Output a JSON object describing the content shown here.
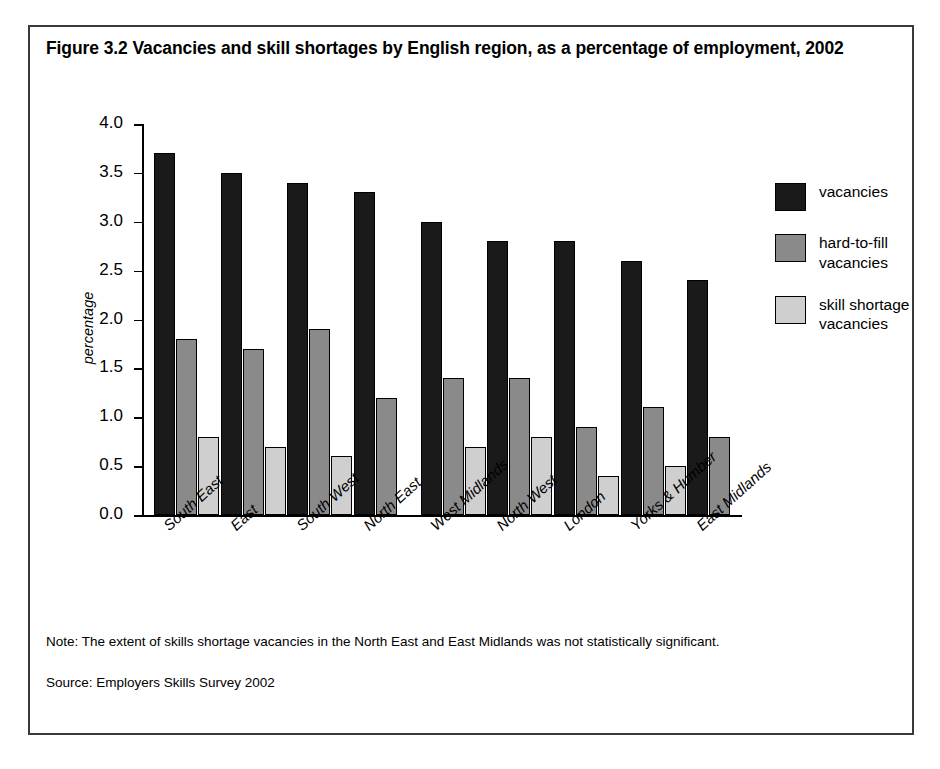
{
  "figure": {
    "title": "Figure 3.2 Vacancies and skill shortages by English region, as a percentage of employment, 2002",
    "note": "Note: The extent of skills shortage vacancies in the North East and East Midlands was not statistically significant.",
    "source": "Source: Employers Skills Survey 2002"
  },
  "legend": {
    "items": [
      {
        "label": "vacancies",
        "color": "#1a1a1a"
      },
      {
        "label": "hard-to-fill vacancies",
        "color": "#8a8a8a"
      },
      {
        "label": "skill shortage vacancies",
        "color": "#cfcfcf"
      }
    ]
  },
  "chart_data": {
    "type": "bar",
    "title": "Figure 3.2 Vacancies and skill shortages by English region, as a percentage of employment, 2002",
    "xlabel": "",
    "ylabel": "percentage",
    "ylim": [
      0.0,
      4.0
    ],
    "ytick_labels": [
      "0.0",
      "0.5",
      "1.0",
      "1.5",
      "2.0",
      "2.5",
      "3.0",
      "3.5",
      "4.0"
    ],
    "ytick_values": [
      0.0,
      0.5,
      1.0,
      1.5,
      2.0,
      2.5,
      3.0,
      3.5,
      4.0
    ],
    "grid": false,
    "legend_position": "right",
    "categories": [
      "South East",
      "East",
      "South West",
      "North East",
      "West Midlands",
      "North West",
      "London",
      "Yorks & Humber",
      "East Midlands"
    ],
    "series": [
      {
        "name": "vacancies",
        "color": "#1a1a1a",
        "values": [
          3.7,
          3.5,
          3.4,
          3.3,
          3.0,
          2.8,
          2.8,
          2.6,
          2.4
        ]
      },
      {
        "name": "hard-to-fill vacancies",
        "color": "#8a8a8a",
        "values": [
          1.8,
          1.7,
          1.9,
          1.2,
          1.4,
          1.4,
          0.9,
          1.1,
          0.8
        ]
      },
      {
        "name": "skill shortage vacancies",
        "color": "#cfcfcf",
        "values": [
          0.8,
          0.7,
          0.6,
          null,
          0.7,
          0.8,
          0.4,
          0.5,
          null
        ]
      }
    ]
  }
}
